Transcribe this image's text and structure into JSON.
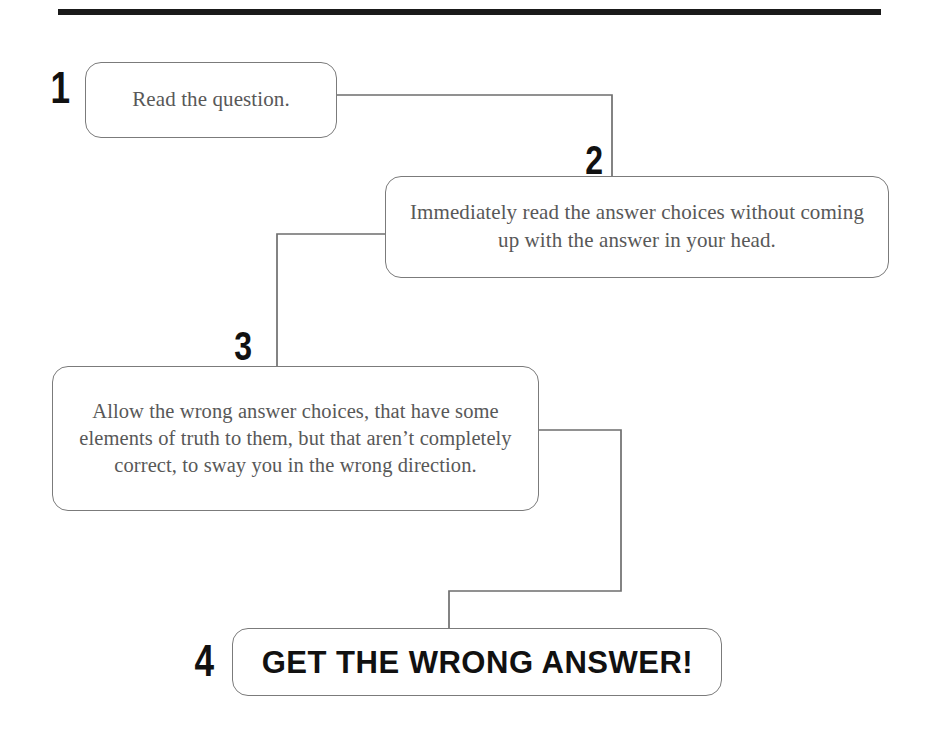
{
  "document": {
    "kind": "flowchart",
    "orientation": "vertical-zigzag",
    "divider": "top-horizontal-rule"
  },
  "theme": {
    "page_background": "#ffffff",
    "box_border": "#7b7b7b",
    "box_fill": "#ffffff",
    "body_text": "#585858",
    "number_text": "#111111",
    "connector_line": "#6e6e6e",
    "rule_color": "#1a1a1a"
  },
  "flowchart": {
    "steps": [
      {
        "number": "1",
        "text": "Read the question.",
        "emphasis": "normal"
      },
      {
        "number": "2",
        "text": "Immediately read the answer choices without coming up with the answer in your head.",
        "emphasis": "normal"
      },
      {
        "number": "3",
        "text": "Allow the wrong answer choices, that have some elements of truth to them, but that aren’t completely correct, to sway you in the wrong direction.",
        "emphasis": "normal"
      },
      {
        "number": "4",
        "text": "GET THE WRONG ANSWER!",
        "emphasis": "bold-uppercase"
      }
    ],
    "connectors": [
      {
        "from": "1",
        "to": "2",
        "path": "right-then-down"
      },
      {
        "from": "2",
        "to": "3",
        "path": "left-then-down"
      },
      {
        "from": "3",
        "to": "4",
        "path": "right-down-left-down"
      }
    ]
  }
}
